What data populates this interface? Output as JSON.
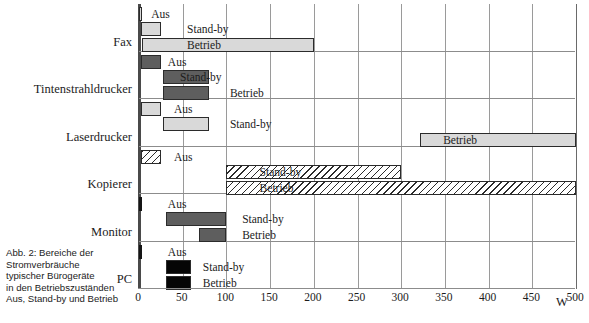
{
  "figure": {
    "caption_lines": [
      "Abb. 2: Bereiche der",
      "Stromverbräuche",
      "typischer Bürogeräte",
      "in den Betriebszuständen",
      "Aus, Stand-by und Betrieb"
    ],
    "unit_label": "W"
  },
  "chart_data": {
    "type": "bar",
    "xlabel": "W",
    "ylabel": "",
    "xlim": [
      0,
      500
    ],
    "xticks": [
      0,
      50,
      100,
      150,
      200,
      250,
      300,
      350,
      400,
      450,
      500
    ],
    "xticklabels": [
      "0",
      "50",
      "100",
      "150",
      "200",
      "250",
      "300",
      "350",
      "400",
      "450",
      "500"
    ],
    "grid": true,
    "orientation": "horizontal",
    "value_type": "range",
    "state_names": [
      "Aus",
      "Stand-by",
      "Betrieb"
    ],
    "categories": [
      "Fax",
      "Tintenstrahldrucker",
      "Laserdrucker",
      "Kopierer",
      "Monitor",
      "PC"
    ],
    "series": [
      {
        "name": "Fax",
        "fill": "light-gray",
        "bars": [
          {
            "state": "Aus",
            "start": 0,
            "end": 3,
            "label": "Aus",
            "label_x": 14
          },
          {
            "state": "Stand-by",
            "start": 2,
            "end": 25,
            "label": "Stand-by",
            "label_x": 55
          },
          {
            "state": "Betrieb",
            "start": 3,
            "end": 200,
            "label": "Betrieb",
            "label_x": 55
          }
        ]
      },
      {
        "name": "Tintenstrahldrucker",
        "fill": "dark-gray",
        "bars": [
          {
            "state": "Aus",
            "start": 2,
            "end": 25,
            "label": "Aus",
            "label_x": 33
          },
          {
            "state": "Stand-by",
            "start": 28,
            "end": 80,
            "label": "Stand-by",
            "label_x": 47
          },
          {
            "state": "Betrieb",
            "start": 28,
            "end": 80,
            "label": "Betrieb",
            "label_x": 104
          }
        ]
      },
      {
        "name": "Laserdrucker",
        "fill": "light-gray",
        "bars": [
          {
            "state": "Aus",
            "start": 2,
            "end": 25,
            "label": "Aus",
            "label_x": 40
          },
          {
            "state": "Stand-by",
            "start": 28,
            "end": 80,
            "label": "Stand-by",
            "label_x": 104
          },
          {
            "state": "Betrieb",
            "start": 322,
            "end": 500,
            "label": "Betrieb",
            "label_x": 348
          }
        ]
      },
      {
        "name": "Kopierer",
        "fill": "hatched",
        "bars": [
          {
            "state": "Aus",
            "start": 2,
            "end": 25,
            "label": "Aus",
            "label_x": 40
          },
          {
            "state": "Stand-by",
            "start": 100,
            "end": 300,
            "label": "Stand-by",
            "label_x": 138
          },
          {
            "state": "Betrieb",
            "start": 100,
            "end": 500,
            "label": "Betrieb",
            "label_x": 138
          }
        ]
      },
      {
        "name": "Monitor",
        "fill": "dark-gray",
        "bars": [
          {
            "state": "Aus",
            "start": 0,
            "end": 1,
            "label": "Aus",
            "label_x": 33
          },
          {
            "state": "Stand-by",
            "start": 31,
            "end": 100,
            "label": "Stand-by",
            "label_x": 118
          },
          {
            "state": "Betrieb",
            "start": 69,
            "end": 100,
            "label": "Betrieb",
            "label_x": 118
          }
        ]
      },
      {
        "name": "PC",
        "fill": "black",
        "bars": [
          {
            "state": "Aus",
            "start": 0,
            "end": 1,
            "label": "Aus",
            "label_x": 33
          },
          {
            "state": "Stand-by",
            "start": 31,
            "end": 60,
            "label": "Stand-by",
            "label_x": 73
          },
          {
            "state": "Betrieb",
            "start": 31,
            "end": 60,
            "label": "Betrieb",
            "label_x": 73
          }
        ]
      }
    ]
  },
  "colors": {
    "light_gray": "#d9d9d9",
    "mid_gray": "#c6c6c6",
    "dark_gray": "#5e5e5e",
    "black": "#050505",
    "grid": "#9a9a9a",
    "outline": "#2b2b2b"
  }
}
